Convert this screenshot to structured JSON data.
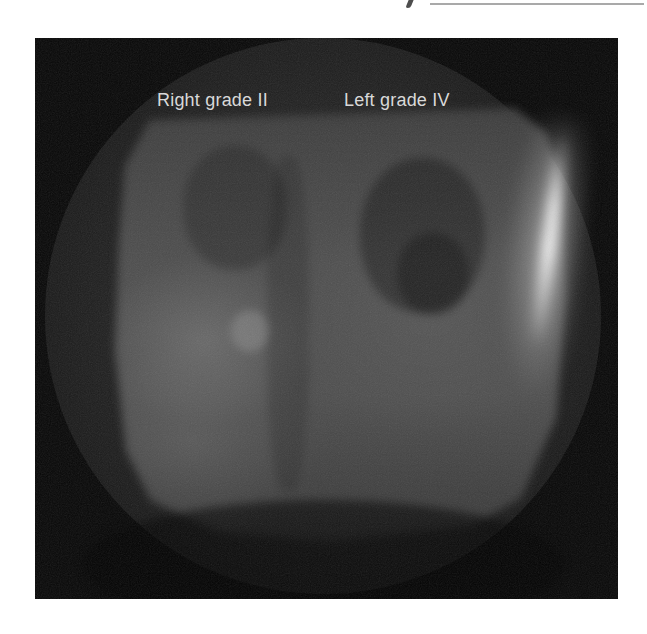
{
  "figure": {
    "description_visible_text_only": "radiograph with two overlay labels",
    "labels": [
      {
        "id": "right",
        "text": "Right grade II"
      },
      {
        "id": "left",
        "text": "Left grade IV"
      }
    ],
    "colors": {
      "page_background": "#ffffff",
      "image_background": "#070707",
      "fluoro_circle_gray": "#212121",
      "field_gray": "#4d4d4d",
      "hotspot_white": "#f5f5f5",
      "label_text": "#d9d9d9",
      "top_artifact_gray": "#9a9a9a"
    }
  }
}
